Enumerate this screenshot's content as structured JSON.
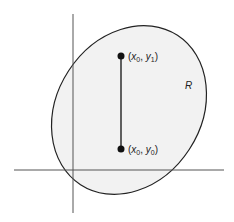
{
  "diagram": {
    "region_label": "R",
    "top_point": {
      "label_x": "x",
      "label_x_sub": "0",
      "label_y": "y",
      "label_y_sub": "1"
    },
    "bottom_point": {
      "label_x": "x",
      "label_x_sub": "0",
      "label_y": "y",
      "label_y_sub": "0"
    },
    "colors": {
      "region_fill": "#f2f2f2",
      "stroke": "#222222",
      "axis": "#555555"
    }
  }
}
